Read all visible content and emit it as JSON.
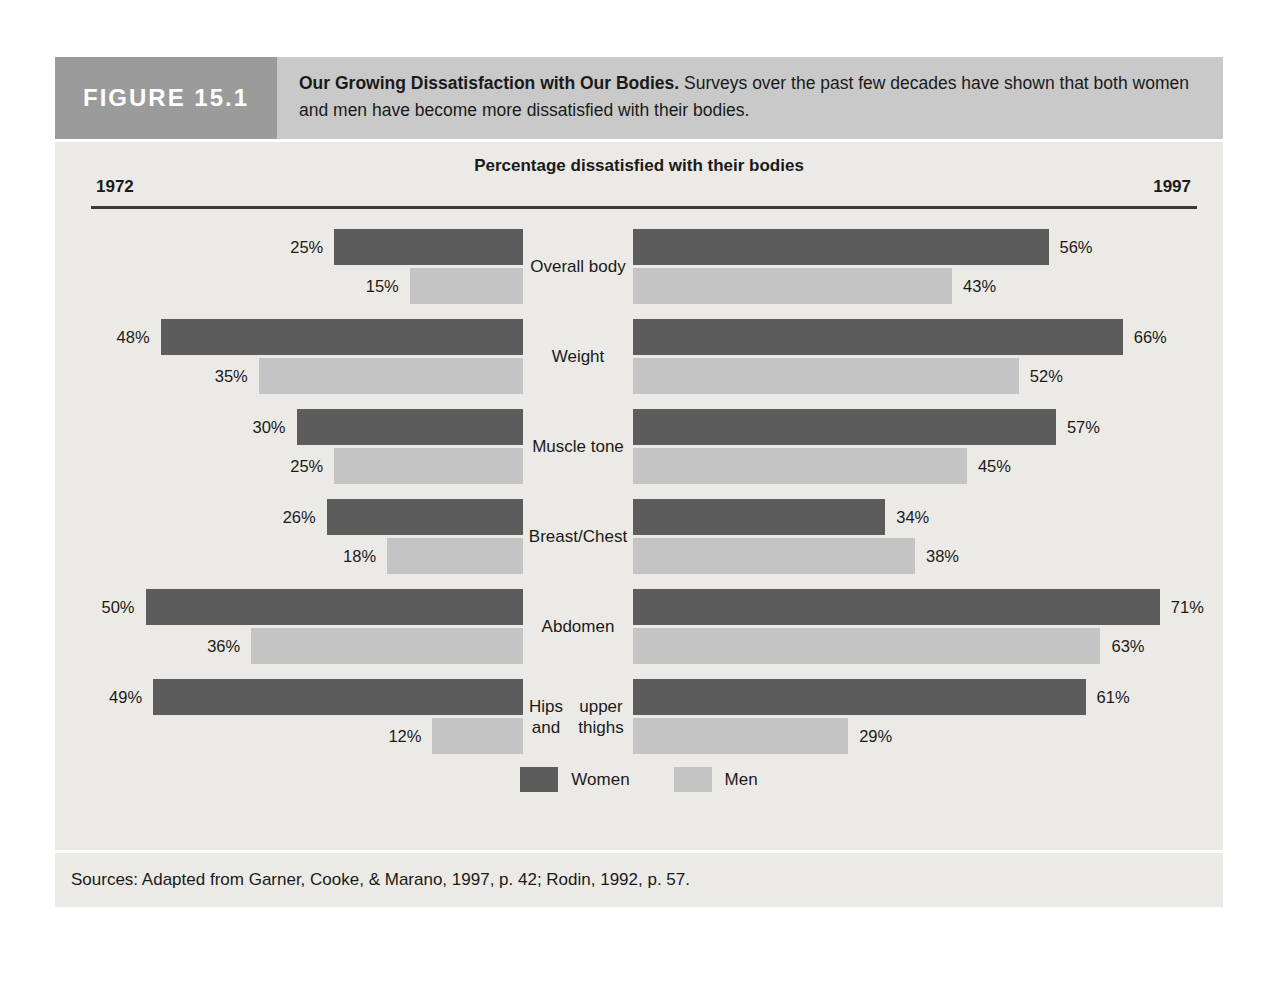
{
  "figure": {
    "label": "FIGURE 15.1",
    "caption_bold": "Our Growing Dissatisfaction with Our Bodies.",
    "caption_rest": " Surveys over the past few decades have shown that both women and men have become more dissatisfied with their bodies.",
    "sources": "Sources: Adapted from Garner, Cooke, & Marano, 1997, p. 42; Rodin, 1992, p. 57."
  },
  "colors": {
    "women": "#5c5c5c",
    "men": "#c4c4c4",
    "panel_bg": "#eceae6",
    "header_bg": "#c9c9c9",
    "label_bg": "#9b9b9b"
  },
  "chart_data": {
    "type": "bar",
    "title": "Percentage dissatisfied with their bodies",
    "subtitle": "",
    "xlabel": "",
    "ylabel": "",
    "grid": false,
    "legend_position": "bottom",
    "orientation": "horizontal",
    "layout": "back-to-back paired panels (1972 left, 1997 right)",
    "panels": [
      {
        "name": "1972",
        "side": "left"
      },
      {
        "name": "1997",
        "side": "right"
      }
    ],
    "legend": [
      "Women",
      "Men"
    ],
    "categories": [
      "Overall body",
      "Weight",
      "Muscle tone",
      "Breast/Chest",
      "Abdomen",
      "Hips and upper thighs"
    ],
    "units": "%",
    "axis_max": 75,
    "series": [
      {
        "name": "Women",
        "panel": "1972",
        "values": [
          25,
          48,
          30,
          26,
          50,
          49
        ]
      },
      {
        "name": "Men",
        "panel": "1972",
        "values": [
          15,
          35,
          25,
          18,
          36,
          12
        ]
      },
      {
        "name": "Women",
        "panel": "1997",
        "values": [
          56,
          66,
          57,
          34,
          71,
          61
        ]
      },
      {
        "name": "Men",
        "panel": "1997",
        "values": [
          43,
          52,
          45,
          38,
          63,
          29
        ]
      }
    ]
  },
  "rows": [
    {
      "label_line1": "Overall body",
      "label_line2": "",
      "left_women": "25%",
      "left_men": "15%",
      "right_women": "56%",
      "right_men": "43%",
      "lw": 25,
      "lm": 15,
      "rw": 56,
      "rm": 43
    },
    {
      "label_line1": "Weight",
      "label_line2": "",
      "left_women": "48%",
      "left_men": "35%",
      "right_women": "66%",
      "right_men": "52%",
      "lw": 48,
      "lm": 35,
      "rw": 66,
      "rm": 52
    },
    {
      "label_line1": "Muscle tone",
      "label_line2": "",
      "left_women": "30%",
      "left_men": "25%",
      "right_women": "57%",
      "right_men": "45%",
      "lw": 30,
      "lm": 25,
      "rw": 57,
      "rm": 45
    },
    {
      "label_line1": "Breast/Chest",
      "label_line2": "",
      "left_women": "26%",
      "left_men": "18%",
      "right_women": "34%",
      "right_men": "38%",
      "lw": 26,
      "lm": 18,
      "rw": 34,
      "rm": 38
    },
    {
      "label_line1": "Abdomen",
      "label_line2": "",
      "left_women": "50%",
      "left_men": "36%",
      "right_women": "71%",
      "right_men": "63%",
      "lw": 50,
      "lm": 36,
      "rw": 71,
      "rm": 63
    },
    {
      "label_line1": "Hips and",
      "label_line2": "upper thighs",
      "left_women": "49%",
      "left_men": "12%",
      "right_women": "61%",
      "right_men": "29%",
      "lw": 49,
      "lm": 12,
      "rw": 61,
      "rm": 29
    }
  ],
  "axis": {
    "title": "Percentage dissatisfied with their bodies",
    "year_left": "1972",
    "year_right": "1997"
  },
  "legend": {
    "women_label": "Women",
    "men_label": "Men"
  }
}
